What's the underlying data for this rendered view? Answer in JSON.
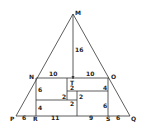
{
  "diagram": {
    "type": "geometry-figure",
    "points": {
      "M": {
        "label": "M",
        "x": 73,
        "y": 13
      },
      "N": {
        "label": "N",
        "x": 36,
        "y": 78
      },
      "O": {
        "label": "O",
        "x": 109,
        "y": 78
      },
      "P": {
        "label": "P",
        "x": 16,
        "y": 116
      },
      "Q": {
        "label": "Q",
        "x": 130,
        "y": 116
      },
      "R": {
        "label": "R",
        "x": 36,
        "y": 116
      },
      "S": {
        "label": "S",
        "x": 108,
        "y": 116
      },
      "T": {
        "label": "T",
        "x": 72,
        "y": 80
      }
    },
    "measurements": {
      "MT": "16",
      "NT": "10",
      "TO": "10",
      "N_left_upper": "6",
      "N_left_lower": "4",
      "PR": "6",
      "R_to_mid": "11",
      "mid_to_S": "9",
      "SQ": "6",
      "O_right_upper": "4",
      "O_right_lower": "6",
      "inner_top": "2",
      "inner_left": "2",
      "inner_right": "2",
      "inner_bottom": "2"
    }
  }
}
